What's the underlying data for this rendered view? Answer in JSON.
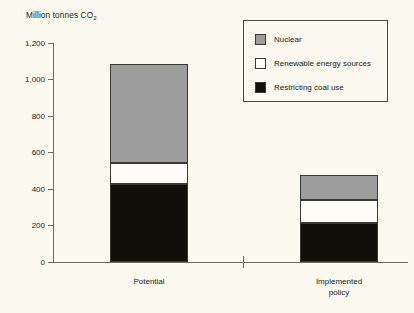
{
  "chart_data": {
    "type": "bar",
    "subtype": "stacked-bar",
    "title": "Million tonnes  CO2",
    "title_main": "Million tonnes  CO",
    "title_sub": "2",
    "xlabel": "",
    "ylabel": "Million tonnes CO2",
    "categories": [
      "Potential",
      "Implemented policy"
    ],
    "category_labels": [
      "Potential",
      "Implemented\npolicy"
    ],
    "series": [
      {
        "name": "Restricting coal use",
        "color": "#120f0b",
        "values": [
          425,
          215
        ]
      },
      {
        "name": "Renewable energy sources",
        "color": "#fdfcf6",
        "values": [
          120,
          125
        ]
      },
      {
        "name": "Nuclear",
        "color": "#9d9d9d",
        "values": [
          540,
          135
        ]
      }
    ],
    "stack_totals": [
      1085,
      475
    ],
    "ylim": [
      0,
      1200
    ],
    "ytick_labels": [
      "1,200",
      "1,000",
      "800",
      "600",
      "400",
      "200",
      "0"
    ],
    "ytick_values": [
      1200,
      1000,
      800,
      600,
      400,
      200,
      0
    ],
    "grid": false,
    "legend_position": "top-right",
    "axis_break": true
  },
  "legend": {
    "entries": [
      {
        "label": "Nuclear",
        "swatch": "nuclear"
      },
      {
        "label": "Renewable energy sources",
        "swatch": "renewable"
      },
      {
        "label": "Restricting coal use",
        "swatch": "coal"
      }
    ]
  },
  "colors": {
    "background": "#fbf9f0",
    "axis": "#6b6b5e",
    "nuclear": "#9d9d9d",
    "renewable": "#fdfcf6",
    "coal": "#120f0b"
  }
}
